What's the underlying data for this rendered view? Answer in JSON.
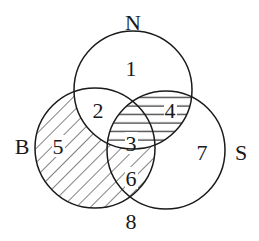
{
  "diagram": {
    "type": "venn-3-set",
    "sets": [
      {
        "name": "N",
        "label": "N",
        "cx": 133,
        "cy": 90,
        "r": 59
      },
      {
        "name": "B",
        "label": "B",
        "cx": 95,
        "cy": 148,
        "r": 60
      },
      {
        "name": "S",
        "label": "S",
        "cx": 166,
        "cy": 150,
        "r": 59
      }
    ],
    "set_labels": {
      "N": {
        "text": "N",
        "x": 133,
        "y": 22
      },
      "B": {
        "text": "B",
        "x": 22,
        "y": 146
      },
      "S": {
        "text": "S",
        "x": 241,
        "y": 152
      }
    },
    "regions": [
      {
        "id": "1",
        "text": "1",
        "x": 131,
        "y": 68,
        "description": "N only",
        "shading": "none"
      },
      {
        "id": "2",
        "text": "2",
        "x": 98,
        "y": 110,
        "description": "N and B, not S",
        "shading": "none"
      },
      {
        "id": "3",
        "text": "3",
        "x": 131,
        "y": 143,
        "description": "N and B and S",
        "shading": "horizontal"
      },
      {
        "id": "4",
        "text": "4",
        "x": 170,
        "y": 110,
        "description": "N and S, not B",
        "shading": "horizontal"
      },
      {
        "id": "5",
        "text": "5",
        "x": 57,
        "y": 146,
        "description": "B only",
        "shading": "diagonal"
      },
      {
        "id": "6",
        "text": "6",
        "x": 131,
        "y": 178,
        "description": "B and S, not N",
        "shading": "diagonal"
      },
      {
        "id": "7",
        "text": "7",
        "x": 202,
        "y": 152,
        "description": "S only",
        "shading": "none"
      },
      {
        "id": "8",
        "text": "8",
        "x": 131,
        "y": 221,
        "description": "outside all sets",
        "shading": "none"
      }
    ],
    "colors": {
      "stroke": "#1a1a1a",
      "background": "#ffffff"
    }
  }
}
